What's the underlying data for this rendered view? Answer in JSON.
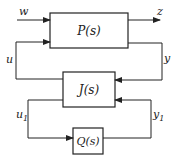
{
  "diagram": {
    "type": "block-diagram",
    "blocks": {
      "P": {
        "label": "P(s)"
      },
      "J": {
        "label": "J(s)"
      },
      "Q": {
        "label": "Q(s)"
      }
    },
    "signals": {
      "w": "w",
      "z": "z",
      "u": "u",
      "y": "y",
      "u1": "u",
      "u1_sub": "1",
      "y1": "y",
      "y1_sub": "1"
    },
    "colors": {
      "stroke": "#222222",
      "background": "#ffffff"
    }
  }
}
